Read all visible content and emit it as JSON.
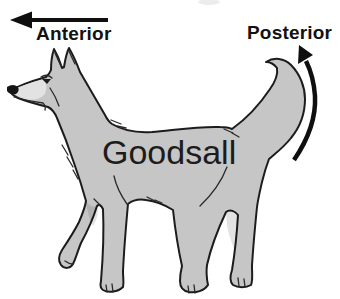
{
  "labels": {
    "anterior": "Anterior",
    "posterior": "Posterior",
    "goodsall": "Goodsall"
  },
  "icons": {
    "anterior_arrow": "arrow-left",
    "posterior_arrow": "curved-arrow-up"
  },
  "colors": {
    "background": "#ffffff",
    "dog_body": "#c6c6c6",
    "dog_muzzle": "#e2e2e2",
    "outline": "#1c1c1c",
    "text": "#121212",
    "arrow": "#0f0f0f"
  }
}
